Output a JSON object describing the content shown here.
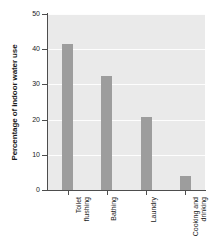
{
  "chart_data": {
    "type": "bar",
    "title": "",
    "xlabel": "",
    "ylabel": "Percentage of indoor water use",
    "categories": [
      "Toilet flushing",
      "Bathing",
      "Laundry",
      "Cooking and drinking"
    ],
    "category_lines": [
      [
        "Toilet",
        "flushing"
      ],
      [
        "Bathing"
      ],
      [
        "Laundry"
      ],
      [
        "Cooking and",
        "drinking"
      ]
    ],
    "values": [
      41.5,
      32.3,
      20.8,
      4.0
    ],
    "ylim": [
      0,
      50
    ],
    "yticks": [
      0,
      10,
      20,
      30,
      40,
      50
    ],
    "ytick_labels": [
      "0",
      "10",
      "20",
      "30",
      "40",
      "50"
    ],
    "grid": "horizontal",
    "legend": "none",
    "colors": {
      "bar": "#9d9d9d",
      "plot_background": "#eaeaea",
      "gridline": "#fdfdfd",
      "axis": "#4d4d4d",
      "text": "#1a1a1a",
      "figure_background": "#ffffff"
    }
  }
}
